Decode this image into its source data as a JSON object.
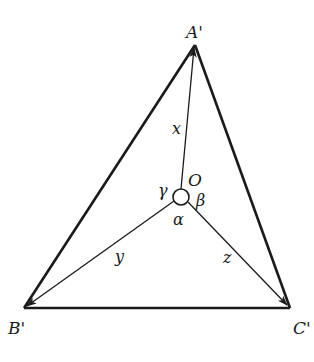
{
  "diagram": {
    "type": "triangle-with-interior-point",
    "vertices": {
      "A": {
        "label": "A'",
        "x": 195,
        "y": 45
      },
      "B": {
        "label": "B'",
        "x": 24,
        "y": 308
      },
      "C": {
        "label": "C'",
        "x": 290,
        "y": 308
      }
    },
    "center": {
      "label": "O",
      "x": 181,
      "y": 197,
      "circle_radius": 8
    },
    "segments": [
      {
        "from": "O",
        "to": "A",
        "label": "x"
      },
      {
        "from": "O",
        "to": "B",
        "label": "y"
      },
      {
        "from": "O",
        "to": "C",
        "label": "z"
      }
    ],
    "angles": [
      {
        "label": "α",
        "between": [
          "y",
          "z"
        ]
      },
      {
        "label": "β",
        "between": [
          "x",
          "z"
        ]
      },
      {
        "label": "γ",
        "between": [
          "x",
          "y"
        ]
      }
    ],
    "colors": {
      "stroke": "#1a1a1a",
      "background": "#ffffff"
    }
  },
  "labels": {
    "A": "A'",
    "B": "B'",
    "C": "C'",
    "O": "O",
    "x": "x",
    "y": "y",
    "z": "z",
    "alpha": "α",
    "beta": "β",
    "gamma": "γ"
  }
}
